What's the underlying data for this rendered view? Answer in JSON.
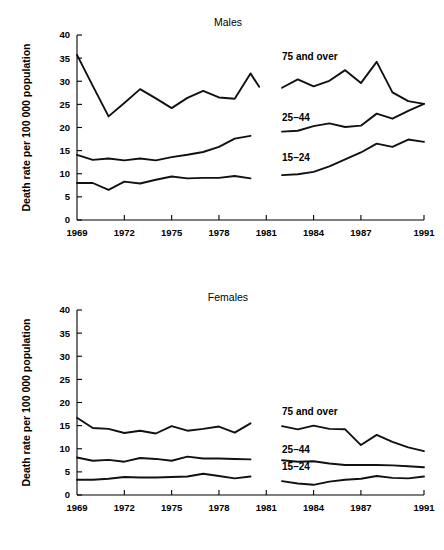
{
  "figure": {
    "background_color": "#ffffff",
    "line_color": "#111111",
    "axis_color": "#000000"
  },
  "chart_data": [
    {
      "type": "line",
      "title": "Males",
      "xlabel": "",
      "ylabel": "Death rate per 100 000 population",
      "xlim": [
        1969,
        1991
      ],
      "ylim": [
        0,
        40
      ],
      "ytick_values": [
        0,
        5,
        10,
        15,
        20,
        25,
        30,
        35,
        40
      ],
      "ytick_labels": [
        "0",
        "5",
        "10",
        "15",
        "20",
        "25",
        "30",
        "35",
        "40"
      ],
      "xtick_values": [
        1969,
        1972,
        1975,
        1978,
        1981,
        1984,
        1987,
        1991
      ],
      "xtick_labels": [
        "1969",
        "1972",
        "1975",
        "1978",
        "1981",
        "1984",
        "1987",
        "1991"
      ],
      "grid": false,
      "legend_position": "inline-annotations",
      "series": [
        {
          "name": "75 and over",
          "annotation": "75 and over",
          "annotation_x": 1982.0,
          "annotation_y": 34.5,
          "segments": [
            {
              "x": [
                1969,
                1970,
                1971,
                1972,
                1973,
                1974,
                1975,
                1976,
                1977,
                1978,
                1979,
                1980
              ],
              "y": [
                35.7,
                29.0,
                22.4,
                25.3,
                28.3,
                26.3,
                24.2,
                26.4,
                27.9,
                26.5,
                26.2,
                31.7
              ],
              "y_end_extra": 28.8
            },
            {
              "x": [
                1982,
                1983,
                1984,
                1985,
                1986,
                1987,
                1988,
                1989,
                1990,
                1991
              ],
              "y": [
                28.6,
                30.4,
                28.9,
                30.1,
                32.4,
                29.6,
                34.2,
                27.6,
                25.7,
                25.1
              ]
            }
          ]
        },
        {
          "name": "25-44",
          "annotation": "25–44",
          "annotation_x": 1982.0,
          "annotation_y": 21.3,
          "segments": [
            {
              "x": [
                1969,
                1970,
                1971,
                1972,
                1973,
                1974,
                1975,
                1976,
                1977,
                1978,
                1979,
                1980
              ],
              "y": [
                14.1,
                13.0,
                13.3,
                12.9,
                13.3,
                12.9,
                13.6,
                14.1,
                14.7,
                15.8,
                17.6,
                18.2
              ]
            },
            {
              "x": [
                1982,
                1983,
                1984,
                1985,
                1986,
                1987,
                1988,
                1989,
                1990,
                1991
              ],
              "y": [
                19.1,
                19.3,
                20.3,
                20.9,
                20.1,
                20.4,
                23.0,
                21.9,
                23.6,
                25.1
              ]
            }
          ]
        },
        {
          "name": "15-24",
          "annotation": "15–24",
          "annotation_x": 1982.0,
          "annotation_y": 12.8,
          "segments": [
            {
              "x": [
                1969,
                1970,
                1971,
                1972,
                1973,
                1974,
                1975,
                1976,
                1977,
                1978,
                1979,
                1980
              ],
              "y": [
                8.0,
                8.0,
                6.5,
                8.3,
                7.9,
                8.7,
                9.4,
                9.0,
                9.1,
                9.1,
                9.5,
                9.0
              ]
            },
            {
              "x": [
                1982,
                1983,
                1984,
                1985,
                1986,
                1987,
                1988,
                1989,
                1990,
                1991
              ],
              "y": [
                9.7,
                9.9,
                10.4,
                11.6,
                13.1,
                14.6,
                16.5,
                15.8,
                17.4,
                16.9
              ]
            }
          ]
        }
      ]
    },
    {
      "type": "line",
      "title": "Females",
      "xlabel": "",
      "ylabel": "Death rate per 100 000 population",
      "xlim": [
        1969,
        1991
      ],
      "ylim": [
        0,
        40
      ],
      "ytick_values": [
        0,
        5,
        10,
        15,
        20,
        25,
        30,
        35,
        40
      ],
      "ytick_labels": [
        "0",
        "5",
        "10",
        "15",
        "20",
        "25",
        "30",
        "35",
        "40"
      ],
      "xtick_values": [
        1969,
        1972,
        1975,
        1978,
        1981,
        1984,
        1987,
        1991
      ],
      "xtick_labels": [
        "1969",
        "1972",
        "1975",
        "1978",
        "1981",
        "1984",
        "1987",
        "1991"
      ],
      "grid": false,
      "legend_position": "inline-annotations",
      "series": [
        {
          "name": "75 and over",
          "annotation": "75 and over",
          "annotation_x": 1982.0,
          "annotation_y": 17.3,
          "segments": [
            {
              "x": [
                1969,
                1970,
                1971,
                1972,
                1973,
                1974,
                1975,
                1976,
                1977,
                1978,
                1979,
                1980
              ],
              "y": [
                16.7,
                14.5,
                14.3,
                13.4,
                13.9,
                13.3,
                14.9,
                13.9,
                14.3,
                14.8,
                13.5,
                15.5
              ]
            },
            {
              "x": [
                1982,
                1983,
                1984,
                1985,
                1986,
                1987,
                1988,
                1989,
                1990,
                1991
              ],
              "y": [
                14.9,
                14.2,
                15.0,
                14.3,
                14.2,
                10.8,
                13.0,
                11.5,
                10.3,
                9.5
              ]
            }
          ]
        },
        {
          "name": "25-44",
          "annotation": "25–44",
          "annotation_x": 1982.0,
          "annotation_y": 9.1,
          "segments": [
            {
              "x": [
                1969,
                1970,
                1971,
                1972,
                1973,
                1974,
                1975,
                1976,
                1977,
                1978,
                1979,
                1980
              ],
              "y": [
                8.1,
                7.4,
                7.6,
                7.2,
                8.0,
                7.8,
                7.4,
                8.3,
                7.9,
                7.9,
                7.8,
                7.7
              ]
            },
            {
              "x": [
                1982,
                1983,
                1984,
                1985,
                1986,
                1987,
                1988,
                1989,
                1990,
                1991
              ],
              "y": [
                7.5,
                7.2,
                7.3,
                6.8,
                6.5,
                6.5,
                6.5,
                6.4,
                6.2,
                6.0
              ]
            }
          ]
        },
        {
          "name": "15-24",
          "annotation": "15–24",
          "annotation_x": 1982.0,
          "annotation_y": 5.3,
          "segments": [
            {
              "x": [
                1969,
                1970,
                1971,
                1972,
                1973,
                1974,
                1975,
                1976,
                1977,
                1978,
                1979,
                1980
              ],
              "y": [
                3.3,
                3.3,
                3.5,
                3.9,
                3.8,
                3.8,
                3.9,
                4.0,
                4.6,
                4.1,
                3.6,
                4.0
              ]
            },
            {
              "x": [
                1982,
                1983,
                1984,
                1985,
                1986,
                1987,
                1988,
                1989,
                1990,
                1991
              ],
              "y": [
                3.0,
                2.5,
                2.2,
                2.9,
                3.3,
                3.5,
                4.1,
                3.7,
                3.6,
                4.0
              ]
            }
          ]
        }
      ]
    }
  ]
}
